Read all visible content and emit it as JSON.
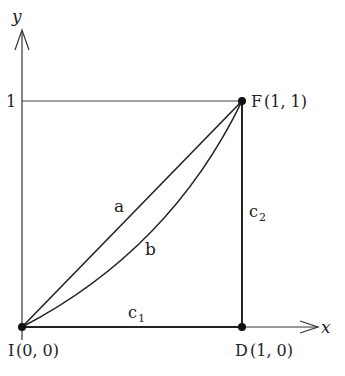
{
  "diagram": {
    "axes": {
      "x_label": "x",
      "y_label": "y",
      "y_tick_label": "1"
    },
    "points": {
      "I": {
        "name": "I",
        "coords": "(0, 0)"
      },
      "D": {
        "name": "D",
        "coords": "(1, 0)"
      },
      "F": {
        "name": "F",
        "coords": "(1, 1)"
      }
    },
    "paths": {
      "a": {
        "label": "a",
        "description": "straight line from I to F"
      },
      "b": {
        "label": "b",
        "description": "curve from I to F below line a"
      },
      "c1": {
        "label": "c",
        "sub": "1",
        "description": "segment from I to D"
      },
      "c2": {
        "label": "c",
        "sub": "2",
        "description": "segment from D to F"
      }
    },
    "colors": {
      "line": "#222222",
      "guide": "#444444"
    }
  }
}
